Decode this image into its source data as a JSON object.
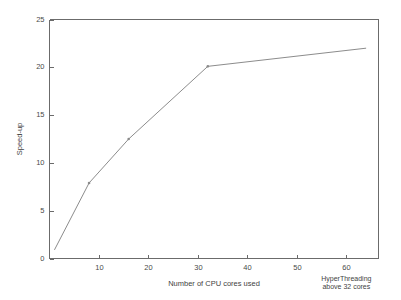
{
  "chart_data": {
    "type": "line",
    "title": "",
    "xlabel": "Number of CPU cores used",
    "ylabel": "Speed-up",
    "xlim": [
      0,
      66.5
    ],
    "ylim": [
      0,
      25
    ],
    "grid": false,
    "legend": null,
    "xticks": [
      10,
      20,
      30,
      40,
      50,
      60
    ],
    "xtick_labels": [
      "10",
      "20",
      "30",
      "40",
      "50",
      "60"
    ],
    "yticks": [
      0,
      5,
      10,
      15,
      20,
      25
    ],
    "ytick_labels": [
      "0",
      "5",
      "10",
      "15",
      "20",
      "25"
    ],
    "series": [
      {
        "name": "Speed-up",
        "color": "#8c8c8c",
        "x": [
          1,
          8,
          16,
          32,
          64
        ],
        "values": [
          0.9,
          7.9,
          12.5,
          20.1,
          22.0
        ]
      }
    ],
    "annotations": [
      {
        "name": "hyperthreading-note",
        "line1": "HyperThreading",
        "line2": "above 32 cores",
        "x": 60,
        "y": -2.6
      }
    ]
  },
  "axis": {
    "x_title": "Number of CPU cores used",
    "y_title": "Speed-up"
  }
}
